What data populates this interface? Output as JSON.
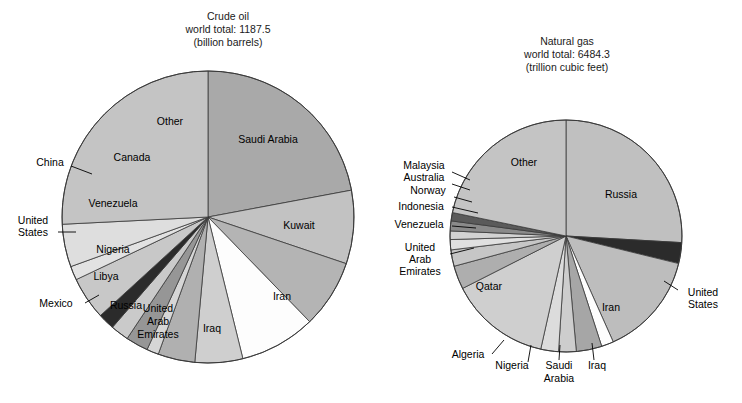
{
  "figure": {
    "width": 742,
    "height": 403,
    "background": "#ffffff"
  },
  "chart_data": [
    {
      "type": "pie",
      "id": "crude-oil",
      "title": "Crude oil",
      "subtitle": "world total: 1187.5",
      "units": "(billion barrels)",
      "title_lines": [
        "Crude oil",
        "world total: 1187.5",
        "(billion barrels)"
      ],
      "total": 1187.5,
      "unit_name": "billion barrels",
      "center": [
        208,
        217
      ],
      "radius": 146,
      "start_angle_deg": -90,
      "direction": "clockwise",
      "legend": "none",
      "grid": false,
      "categories": [
        "Saudi Arabia",
        "Kuwait",
        "Iran",
        "Iraq",
        "United Arab Emirates",
        "Russia",
        "Mexico",
        "Libya",
        "Nigeria",
        "United States",
        "Venezuela",
        "China",
        "Canada",
        "Other"
      ],
      "values": [
        261.9,
        96.5,
        89.7,
        100.0,
        62.8,
        48.6,
        15.7,
        29.5,
        24.0,
        21.8,
        56.3,
        18.3,
        56.1,
        306.3
      ],
      "percents": [
        22.1,
        8.1,
        7.6,
        8.4,
        5.3,
        4.1,
        1.3,
        2.5,
        2.0,
        1.8,
        4.7,
        1.5,
        4.7,
        25.8
      ],
      "colors": [
        "#a9a9a9",
        "#c2c2c2",
        "#b4b4b4",
        "#fdfdfd",
        "#cfcfcf",
        "#b0b0b0",
        "#d6d6d6",
        "#969696",
        "#cacaca",
        "#2b2b2b",
        "#c8c8c8",
        "#e2e2e2",
        "#dedede",
        "#c4c4c4"
      ],
      "inside_labels": [
        "Saudi Arabia",
        "Kuwait",
        "Iran",
        "Iraq",
        "United Arab Emirates",
        "Russia",
        "Libya",
        "Nigeria",
        "Venezuela",
        "Canada",
        "Other"
      ],
      "callout_labels": [
        "Mexico",
        "United States",
        "China"
      ]
    },
    {
      "type": "pie",
      "id": "natural-gas",
      "title": "Natural gas",
      "subtitle": "world total: 6484.3",
      "units": "(trillion cubic feet)",
      "title_lines": [
        "Natural gas",
        "world total: 6484.3",
        "(trillion cubic feet)"
      ],
      "total": 6484.3,
      "unit_name": "trillion cubic feet",
      "center": [
        566,
        236
      ],
      "radius": 116,
      "start_angle_deg": -90,
      "direction": "clockwise",
      "legend": "none",
      "grid": false,
      "categories": [
        "Russia",
        "United States",
        "Iran",
        "Iraq",
        "Saudi Arabia",
        "Nigeria",
        "Algeria",
        "Qatar",
        "United Arab Emirates",
        "Venezuela",
        "Indonesia",
        "Norway",
        "Australia",
        "Malaysia",
        "Other"
      ],
      "values": [
        1680.0,
        189.0,
        940.0,
        110.0,
        231.0,
        159.0,
        160.0,
        910.0,
        212.0,
        148.0,
        92.5,
        77.0,
        90.0,
        75.0,
        1410.8
      ],
      "percents": [
        25.9,
        2.9,
        14.5,
        1.7,
        3.6,
        2.5,
        2.5,
        14.0,
        3.3,
        2.3,
        1.4,
        1.2,
        1.4,
        1.2,
        21.6
      ],
      "colors": [
        "#c0c0c0",
        "#2b2b2b",
        "#bdbdbd",
        "#fdfdfd",
        "#a6a6a6",
        "#cdcdcd",
        "#dcdcdc",
        "#cfcfcf",
        "#aeaeae",
        "#c6c6c6",
        "#e0e0e0",
        "#d2d2d2",
        "#8a8a8a",
        "#5a5a5a",
        "#c4c4c4"
      ],
      "inside_labels": [
        "Russia",
        "Iran",
        "Qatar",
        "Other"
      ],
      "callout_labels": [
        "United States",
        "Iraq",
        "Saudi Arabia",
        "Nigeria",
        "Algeria",
        "United Arab Emirates",
        "Venezuela",
        "Indonesia",
        "Norway",
        "Australia",
        "Malaysia"
      ]
    }
  ],
  "labels": {
    "left": {
      "inside": [
        {
          "text": "Saudi Arabia",
          "x": 268,
          "y": 143,
          "anchor": "middle"
        },
        {
          "text": "Kuwait",
          "x": 299,
          "y": 229,
          "anchor": "middle"
        },
        {
          "text": "Iran",
          "x": 282,
          "y": 300,
          "anchor": "middle"
        },
        {
          "text": "Iraq",
          "x": 212,
          "y": 332,
          "anchor": "middle"
        },
        {
          "text": "United",
          "x": 158,
          "y": 312,
          "anchor": "middle"
        },
        {
          "text": "Arab",
          "x": 158,
          "y": 325,
          "anchor": "middle"
        },
        {
          "text": "Emirates",
          "x": 158,
          "y": 338,
          "anchor": "middle"
        },
        {
          "text": "Russia",
          "x": 126,
          "y": 309,
          "anchor": "middle"
        },
        {
          "text": "Libya",
          "x": 106,
          "y": 280,
          "anchor": "middle"
        },
        {
          "text": "Nigeria",
          "x": 113,
          "y": 253,
          "anchor": "middle"
        },
        {
          "text": "Venezuela",
          "x": 113,
          "y": 207,
          "anchor": "middle"
        },
        {
          "text": "Canada",
          "x": 132,
          "y": 161,
          "anchor": "middle"
        },
        {
          "text": "Other",
          "x": 170,
          "y": 125,
          "anchor": "middle"
        }
      ],
      "callouts": [
        {
          "text": "China",
          "x": 50,
          "y": 166,
          "anchor": "middle",
          "line": [
            [
              71,
              166
            ],
            [
              92,
              174
            ]
          ]
        },
        {
          "text": "United",
          "x": 33,
          "y": 224,
          "anchor": "middle",
          "line": [
            [
              58,
              232
            ],
            [
              76,
              232
            ]
          ]
        },
        {
          "text": "States",
          "x": 33,
          "y": 236,
          "anchor": "middle",
          "line": null
        },
        {
          "text": "Mexico",
          "x": 56,
          "y": 307,
          "anchor": "middle",
          "line": [
            [
              85,
              303
            ],
            [
              99,
              295
            ]
          ]
        }
      ]
    },
    "right": {
      "inside": [
        {
          "text": "Other",
          "x": 524,
          "y": 166,
          "anchor": "middle"
        },
        {
          "text": "Russia",
          "x": 621,
          "y": 198,
          "anchor": "middle"
        },
        {
          "text": "Iran",
          "x": 611,
          "y": 311,
          "anchor": "middle"
        },
        {
          "text": "Qatar",
          "x": 489,
          "y": 290,
          "anchor": "middle"
        }
      ],
      "callouts": [
        {
          "text": "Malaysia",
          "x": 424,
          "y": 169,
          "anchor": "middle",
          "line": [
            [
              452,
              172
            ],
            [
              470,
              180
            ]
          ]
        },
        {
          "text": "Australia",
          "x": 424,
          "y": 181,
          "anchor": "middle",
          "line": [
            [
              452,
              184
            ],
            [
              470,
              190
            ]
          ]
        },
        {
          "text": "Norway",
          "x": 428,
          "y": 194,
          "anchor": "middle",
          "line": [
            [
              454,
              197
            ],
            [
              472,
              202
            ]
          ]
        },
        {
          "text": "Indonesia",
          "x": 421,
          "y": 210,
          "anchor": "middle",
          "line": [
            [
              452,
              207
            ],
            [
              478,
              213
            ]
          ]
        },
        {
          "text": "Venezuela",
          "x": 419,
          "y": 228,
          "anchor": "middle",
          "line": [
            [
              452,
              226
            ],
            [
              476,
              228
            ]
          ]
        },
        {
          "text": "United",
          "x": 420,
          "y": 251,
          "anchor": "middle",
          "line": [
            [
              450,
              254
            ],
            [
              474,
              248
            ]
          ]
        },
        {
          "text": "Arab",
          "x": 420,
          "y": 263,
          "anchor": "middle",
          "line": null
        },
        {
          "text": "Emirates",
          "x": 420,
          "y": 275,
          "anchor": "middle",
          "line": null
        },
        {
          "text": "United",
          "x": 703,
          "y": 296,
          "anchor": "middle",
          "line": [
            [
              678,
              290
            ],
            [
              664,
              281
            ]
          ]
        },
        {
          "text": "States",
          "x": 703,
          "y": 308,
          "anchor": "middle",
          "line": null
        },
        {
          "text": "Algeria",
          "x": 468,
          "y": 358,
          "anchor": "middle",
          "line": [
            [
              492,
              354
            ],
            [
              504,
              340
            ]
          ]
        },
        {
          "text": "Nigeria",
          "x": 512,
          "y": 369,
          "anchor": "middle",
          "line": [
            [
              528,
              362
            ],
            [
              531,
              345
            ]
          ]
        },
        {
          "text": "Saudi",
          "x": 559,
          "y": 369,
          "anchor": "middle",
          "line": [
            [
              559,
              360
            ],
            [
              560,
              345
            ]
          ]
        },
        {
          "text": "Arabia",
          "x": 559,
          "y": 382,
          "anchor": "middle",
          "line": null
        },
        {
          "text": "Iraq",
          "x": 597,
          "y": 369,
          "anchor": "middle",
          "line": [
            [
              594,
              360
            ],
            [
              592,
              343
            ]
          ]
        }
      ]
    }
  }
}
